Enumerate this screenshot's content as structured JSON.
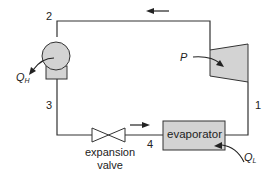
{
  "diagram": {
    "state_points": [
      "1",
      "2",
      "3",
      "4"
    ],
    "components": {
      "condenser": {
        "heat_label": "Q",
        "heat_sub": "H"
      },
      "compressor": {
        "power_label": "P"
      },
      "expansion_valve": {
        "label_line1": "expansion",
        "label_line2": "valve"
      },
      "evaporator": {
        "label": "evaporator",
        "heat_label": "Q",
        "heat_sub": "L"
      }
    },
    "flow_direction": "counter-clockwise (compressor → condenser → valve → evaporator)",
    "colors": {
      "line": "#333333",
      "fill": "#d3d3d3",
      "background": "#ffffff"
    }
  }
}
